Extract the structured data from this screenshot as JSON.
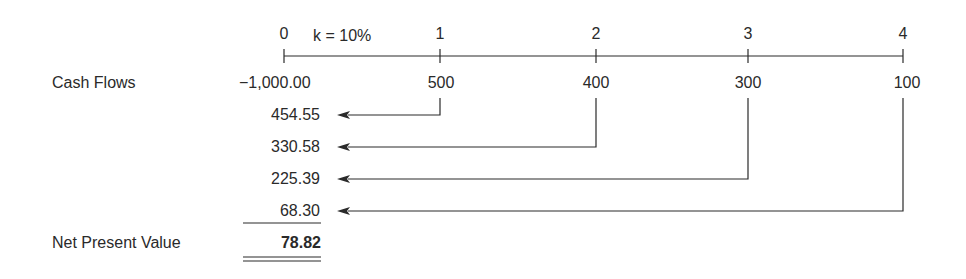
{
  "timeline": {
    "rate_label": "k = 10%",
    "periods": [
      "0",
      "1",
      "2",
      "3",
      "4"
    ]
  },
  "rows": {
    "cash_flows_label": "Cash Flows",
    "cash_flows": [
      "−1,000.00",
      "500",
      "400",
      "300",
      "100"
    ],
    "present_values": [
      "454.55",
      "330.58",
      "225.39",
      "68.30"
    ],
    "npv_label": "Net Present Value",
    "npv_value": "78.82"
  },
  "colors": {
    "ink": "#2a2a2a",
    "background": "#ffffff"
  }
}
